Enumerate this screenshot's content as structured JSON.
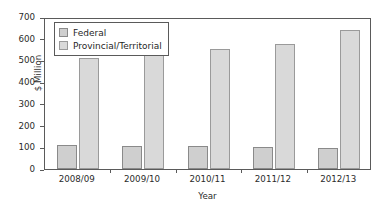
{
  "chart_data": {
    "type": "bar",
    "title": "",
    "subtitle": "",
    "xlabel": "Year",
    "ylabel": "$ Million",
    "categories": [
      "2008/09",
      "2009/10",
      "2010/11",
      "2011/12",
      "2012/13"
    ],
    "series": [
      {
        "name": "Federal",
        "color": "#cfcfcf",
        "values": [
          110,
          107,
          104,
          102,
          98
        ]
      },
      {
        "name": "Provincial/Territorial",
        "color": "#d9d9d9",
        "values": [
          510,
          538,
          553,
          578,
          642
        ]
      }
    ],
    "ylim": [
      0,
      700
    ],
    "ytick_values": [
      0,
      100,
      200,
      300,
      400,
      500,
      600,
      700
    ],
    "ytick_labels": [
      "0",
      "100",
      "200",
      "300",
      "400",
      "500",
      "600",
      "700"
    ],
    "grid": false,
    "legend_position": "upper left",
    "legend_entries": [
      "Federal",
      "Provincial/Territorial"
    ]
  }
}
